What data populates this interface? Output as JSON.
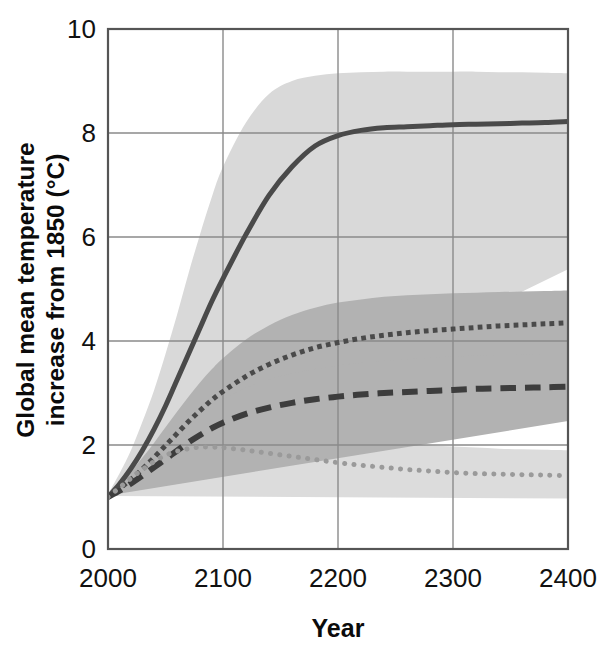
{
  "chart_data": {
    "type": "line",
    "title": "",
    "xlabel": "Year",
    "ylabel": "Global mean temperature increase from 1850 (°C)",
    "ylabel_line1": "Global mean temperature",
    "ylabel_line2": "increase from 1850 (°C)",
    "xlim": [
      2000,
      2400
    ],
    "ylim": [
      0,
      10
    ],
    "xticks": [
      2000,
      2100,
      2200,
      2300,
      2400
    ],
    "xtick_labels": [
      "2000",
      "2100",
      "2200",
      "2300",
      "2400"
    ],
    "yticks": [
      0,
      2,
      4,
      6,
      8,
      10
    ],
    "ytick_labels": [
      "0",
      "2",
      "4",
      "6",
      "8",
      "10"
    ],
    "grid": true,
    "grid_color": "#8a8a8a",
    "frame_color": "#555555",
    "legend": "none",
    "background": "#ffffff",
    "x": [
      2000,
      2010,
      2020,
      2030,
      2040,
      2050,
      2060,
      2070,
      2080,
      2090,
      2100,
      2120,
      2140,
      2160,
      2180,
      2200,
      2220,
      2240,
      2260,
      2280,
      2300,
      2320,
      2340,
      2360,
      2380,
      2400
    ],
    "series": [
      {
        "name": "high-emissions-scenario",
        "style": "solid",
        "color": "#4a4a4a",
        "width": 5,
        "band_color": "#d9d9d9",
        "band_opacity": 1,
        "values": [
          1.0,
          1.25,
          1.55,
          1.9,
          2.3,
          2.75,
          3.25,
          3.75,
          4.25,
          4.75,
          5.2,
          6.05,
          6.8,
          7.35,
          7.75,
          7.95,
          8.05,
          8.1,
          8.12,
          8.14,
          8.16,
          8.17,
          8.18,
          8.19,
          8.2,
          8.22
        ],
        "band_lower": [
          0.95,
          1.1,
          1.3,
          1.55,
          1.82,
          2.12,
          2.45,
          2.78,
          3.1,
          3.42,
          3.7,
          4.2,
          4.62,
          4.92,
          5.1,
          5.2,
          5.25,
          5.28,
          5.3,
          5.32,
          5.33,
          5.34,
          5.35,
          5.36,
          5.37,
          5.38
        ],
        "band_upper": [
          1.05,
          1.45,
          1.9,
          2.45,
          3.05,
          3.75,
          4.5,
          5.3,
          6.05,
          6.75,
          7.35,
          8.2,
          8.75,
          9.0,
          9.1,
          9.15,
          9.17,
          9.18,
          9.18,
          9.18,
          9.18,
          9.18,
          9.17,
          9.17,
          9.16,
          9.15
        ]
      },
      {
        "name": "medium-high-emissions-scenario",
        "style": "dotted-square",
        "color": "#4a4a4a",
        "width": 5,
        "band_color": "#b2b2b2",
        "band_opacity": 1,
        "values": [
          1.0,
          1.16,
          1.34,
          1.54,
          1.76,
          1.99,
          2.22,
          2.45,
          2.66,
          2.86,
          3.03,
          3.32,
          3.55,
          3.73,
          3.87,
          3.97,
          4.05,
          4.11,
          4.16,
          4.2,
          4.23,
          4.26,
          4.29,
          4.31,
          4.33,
          4.35
        ],
        "band_lower": [
          0.96,
          1.08,
          1.2,
          1.34,
          1.49,
          1.64,
          1.8,
          1.95,
          2.09,
          2.22,
          2.34,
          2.54,
          2.7,
          2.83,
          2.93,
          3.01,
          3.07,
          3.12,
          3.16,
          3.2,
          3.23,
          3.25,
          3.28,
          3.3,
          3.32,
          3.34
        ],
        "band_upper": [
          1.04,
          1.26,
          1.5,
          1.76,
          2.04,
          2.34,
          2.64,
          2.93,
          3.2,
          3.45,
          3.67,
          4.03,
          4.3,
          4.5,
          4.64,
          4.74,
          4.8,
          4.85,
          4.88,
          4.9,
          4.92,
          4.93,
          4.94,
          4.95,
          4.96,
          4.97
        ]
      },
      {
        "name": "medium-emissions-scenario",
        "style": "dashed",
        "color": "#3d3d3d",
        "width": 6,
        "band_color": "#b2b2b2",
        "band_opacity": 1,
        "values": [
          1.0,
          1.12,
          1.26,
          1.41,
          1.57,
          1.73,
          1.89,
          2.05,
          2.19,
          2.32,
          2.43,
          2.6,
          2.72,
          2.81,
          2.88,
          2.93,
          2.97,
          3.0,
          3.02,
          3.04,
          3.06,
          3.08,
          3.09,
          3.1,
          3.11,
          3.12
        ],
        "band_lower": [
          0.97,
          1.06,
          1.15,
          1.25,
          1.36,
          1.47,
          1.58,
          1.68,
          1.78,
          1.87,
          1.95,
          2.07,
          2.16,
          2.23,
          2.28,
          2.32,
          2.35,
          2.37,
          2.39,
          2.41,
          2.42,
          2.43,
          2.44,
          2.45,
          2.46,
          2.46
        ],
        "band_upper": [
          1.03,
          1.18,
          1.37,
          1.57,
          1.78,
          1.99,
          2.2,
          2.4,
          2.58,
          2.74,
          2.88,
          3.1,
          3.26,
          3.38,
          3.46,
          3.53,
          3.58,
          3.62,
          3.65,
          3.68,
          3.7,
          3.72,
          3.73,
          3.74,
          3.75,
          3.76
        ]
      },
      {
        "name": "low-emissions-scenario",
        "style": "dotted-round",
        "color": "#9a9a9a",
        "width": 5,
        "band_color": "#dcdcdc",
        "band_opacity": 1,
        "values": [
          1.0,
          1.18,
          1.36,
          1.53,
          1.68,
          1.8,
          1.88,
          1.93,
          1.96,
          1.96,
          1.95,
          1.9,
          1.84,
          1.78,
          1.72,
          1.66,
          1.61,
          1.57,
          1.53,
          1.5,
          1.47,
          1.45,
          1.44,
          1.43,
          1.42,
          1.41
        ],
        "band_lower": [
          0.98,
          1.1,
          1.22,
          1.33,
          1.42,
          1.48,
          1.52,
          1.54,
          1.54,
          1.53,
          1.51,
          1.45,
          1.38,
          1.31,
          1.24,
          1.18,
          1.13,
          1.09,
          1.06,
          1.03,
          1.01,
          1.0,
          0.99,
          0.98,
          0.98,
          0.97
        ],
        "band_upper": [
          1.02,
          1.25,
          1.48,
          1.7,
          1.9,
          2.05,
          2.16,
          2.23,
          2.27,
          2.29,
          2.29,
          2.27,
          2.24,
          2.2,
          2.16,
          2.12,
          2.08,
          2.05,
          2.02,
          1.99,
          1.97,
          1.95,
          1.93,
          1.92,
          1.91,
          1.9
        ]
      }
    ]
  }
}
